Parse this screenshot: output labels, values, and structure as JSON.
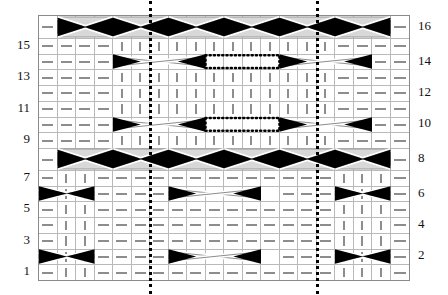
{
  "chart_data": {
    "type": "table",
    "xlabel": "",
    "ylabel": "",
    "grid": true,
    "legend_position": "none",
    "columns": 20,
    "rows": 16,
    "row_labels_left": [
      "15",
      "13",
      "11",
      "9",
      "7",
      "5",
      "3",
      "1"
    ],
    "row_labels_right": [
      "16",
      "14",
      "12",
      "10",
      "8",
      "6",
      "4",
      "2"
    ],
    "left_label_rows": [
      15,
      13,
      11,
      9,
      7,
      5,
      3,
      1
    ],
    "right_label_rows": [
      16,
      14,
      12,
      10,
      8,
      6,
      4,
      2
    ],
    "symbols": {
      "dash": "purl",
      "bar": "knit",
      "left_triangle": "left-cross",
      "right_triangle": "right-cross",
      "band": "cable-band"
    },
    "repeat_marker_columns": [
      6,
      15
    ],
    "cells": [
      "-||--=-=--||||||--=-=--||-",
      "-||--=-=--||||||--=-=--||-"
    ],
    "grid_rows": [
      {
        "row": 16,
        "type": "cable",
        "symbols": [
          "dash",
          "cable",
          "cable",
          "cable",
          "cable",
          "cable",
          "cable",
          "cable",
          "cable",
          "cable",
          "cable",
          "cable",
          "cable",
          "cable",
          "cable",
          "cable",
          "cable",
          "cable",
          "cable",
          "dash"
        ]
      },
      {
        "row": 15,
        "type": "plain",
        "symbols": [
          "dash",
          "dash",
          "dash",
          "dash",
          "bar",
          "bar",
          "bar",
          "bar",
          "bar",
          "bar",
          "bar",
          "bar",
          "bar",
          "bar",
          "bar",
          "bar",
          "dash",
          "dash",
          "dash",
          "dash"
        ]
      },
      {
        "row": 14,
        "type": "travel",
        "symbols": [
          "dash",
          "dash",
          "dash",
          "dash",
          "cross",
          "cross",
          "cross",
          "cross",
          "cross",
          "cross",
          "cross",
          "cross",
          "cross",
          "cross",
          "cross",
          "cross",
          "dash",
          "dash",
          "dash",
          "dash"
        ]
      },
      {
        "row": 13,
        "type": "plain",
        "symbols": [
          "dash",
          "dash",
          "dash",
          "dash",
          "bar",
          "bar",
          "bar",
          "bar",
          "bar",
          "bar",
          "bar",
          "bar",
          "bar",
          "bar",
          "bar",
          "bar",
          "dash",
          "dash",
          "dash",
          "dash"
        ]
      },
      {
        "row": 12,
        "type": "plain",
        "symbols": [
          "dash",
          "dash",
          "dash",
          "dash",
          "bar",
          "bar",
          "bar",
          "bar",
          "bar",
          "bar",
          "bar",
          "bar",
          "bar",
          "bar",
          "bar",
          "bar",
          "dash",
          "dash",
          "dash",
          "dash"
        ]
      },
      {
        "row": 11,
        "type": "plain",
        "symbols": [
          "dash",
          "dash",
          "dash",
          "dash",
          "bar",
          "bar",
          "bar",
          "bar",
          "bar",
          "bar",
          "bar",
          "bar",
          "bar",
          "bar",
          "bar",
          "bar",
          "dash",
          "dash",
          "dash",
          "dash"
        ]
      },
      {
        "row": 10,
        "type": "travel",
        "symbols": [
          "dash",
          "dash",
          "dash",
          "dash",
          "cross",
          "cross",
          "cross",
          "cross",
          "cross",
          "cross",
          "cross",
          "cross",
          "cross",
          "cross",
          "cross",
          "cross",
          "dash",
          "dash",
          "dash",
          "dash"
        ]
      },
      {
        "row": 9,
        "type": "plain",
        "symbols": [
          "dash",
          "dash",
          "dash",
          "dash",
          "bar",
          "bar",
          "bar",
          "bar",
          "bar",
          "bar",
          "bar",
          "bar",
          "bar",
          "bar",
          "bar",
          "bar",
          "dash",
          "dash",
          "dash",
          "dash"
        ]
      },
      {
        "row": 8,
        "type": "cable",
        "symbols": [
          "dash",
          "cable",
          "cable",
          "cable",
          "cable",
          "cable",
          "cable",
          "cable",
          "cable",
          "cable",
          "cable",
          "cable",
          "cable",
          "cable",
          "cable",
          "cable",
          "cable",
          "cable",
          "cable",
          "dash"
        ]
      },
      {
        "row": 7,
        "type": "plain",
        "symbols": [
          "dash",
          "bar",
          "bar",
          "dash",
          "dash",
          "dash",
          "dash",
          "dash",
          "dash",
          "dash",
          "dash",
          "dash",
          "dash",
          "dash",
          "dash",
          "dash",
          "bar",
          "bar",
          "bar",
          "dash"
        ]
      },
      {
        "row": 6,
        "type": "travel",
        "symbols": [
          "dash",
          "bar",
          "bar",
          "dash",
          "dash",
          "dash",
          "dash",
          "cross",
          "cross",
          "cross",
          "cross",
          "cross",
          "cross",
          "dash",
          "dash",
          "dash",
          "bar",
          "bar",
          "bar",
          "dash"
        ]
      },
      {
        "row": 5,
        "type": "plain",
        "symbols": [
          "dash",
          "bar",
          "bar",
          "dash",
          "dash",
          "dash",
          "dash",
          "dash",
          "dash",
          "dash",
          "dash",
          "dash",
          "dash",
          "dash",
          "dash",
          "dash",
          "bar",
          "bar",
          "bar",
          "dash"
        ]
      },
      {
        "row": 4,
        "type": "plain",
        "symbols": [
          "dash",
          "bar",
          "bar",
          "dash",
          "dash",
          "dash",
          "dash",
          "dash",
          "dash",
          "dash",
          "dash",
          "dash",
          "dash",
          "dash",
          "dash",
          "dash",
          "bar",
          "bar",
          "bar",
          "dash"
        ]
      },
      {
        "row": 3,
        "type": "plain",
        "symbols": [
          "dash",
          "bar",
          "bar",
          "dash",
          "dash",
          "dash",
          "dash",
          "dash",
          "dash",
          "dash",
          "dash",
          "dash",
          "dash",
          "dash",
          "dash",
          "dash",
          "bar",
          "bar",
          "bar",
          "dash"
        ]
      },
      {
        "row": 2,
        "type": "travel",
        "symbols": [
          "dash",
          "bar",
          "bar",
          "dash",
          "dash",
          "dash",
          "dash",
          "cross",
          "cross",
          "cross",
          "cross",
          "cross",
          "cross",
          "dash",
          "dash",
          "dash",
          "bar",
          "bar",
          "bar",
          "dash"
        ]
      },
      {
        "row": 1,
        "type": "plain",
        "symbols": [
          "dash",
          "bar",
          "bar",
          "dash",
          "dash",
          "dash",
          "dash",
          "dash",
          "dash",
          "dash",
          "dash",
          "dash",
          "dash",
          "dash",
          "dash",
          "dash",
          "bar",
          "bar",
          "bar",
          "dash"
        ]
      }
    ]
  },
  "colors": {
    "symbol": "#8d8d8d",
    "grid_line": "#b9b9b9",
    "border": "#8a8a8a",
    "cable_fill": "#d8d8d8",
    "solid": "#000000",
    "repeat_marker": "#000000",
    "label": "#111111",
    "background": "#ffffff"
  }
}
